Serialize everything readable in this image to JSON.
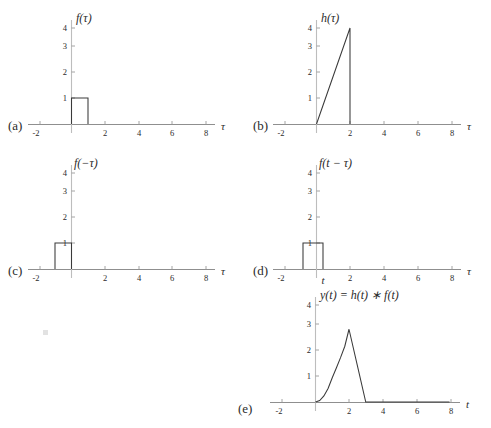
{
  "figure": {
    "background": "#ffffff",
    "curve_color": "#3a3a3a",
    "axis_color": "#8f8f8f",
    "text_color": "#2b2b2b"
  },
  "panels": {
    "a": {
      "tag": "(a)",
      "title": "f(τ)",
      "xlabel": "τ",
      "xticks": [
        "-2",
        "2",
        "4",
        "6",
        "8"
      ],
      "yticks": [
        "1",
        "2",
        "3",
        "4"
      ]
    },
    "b": {
      "tag": "(b)",
      "title": "h(τ)",
      "xlabel": "τ",
      "xticks": [
        "-2",
        "2",
        "4",
        "6",
        "8"
      ],
      "yticks": [
        "1",
        "2",
        "3",
        "4"
      ]
    },
    "c": {
      "tag": "(c)",
      "title": "f(−τ)",
      "xlabel": "τ",
      "xticks": [
        "-2",
        "2",
        "4",
        "6",
        "8"
      ],
      "yticks": [
        "1",
        "2",
        "3",
        "4"
      ]
    },
    "d": {
      "tag": "(d)",
      "title": "f(t − τ)",
      "xlabel": "τ",
      "xticks": [
        "-2",
        "2",
        "4",
        "6",
        "8"
      ],
      "yticks": [
        "1",
        "2",
        "3",
        "4"
      ],
      "shift_marker": "t"
    },
    "e": {
      "tag": "(e)",
      "title": "y(t) = h(t) ∗ f(t)",
      "xlabel": "t",
      "xticks": [
        "-2",
        "2",
        "4",
        "6",
        "8"
      ],
      "yticks": [
        "1",
        "2",
        "3",
        "4"
      ]
    }
  },
  "chart_data": [
    {
      "type": "line",
      "panel": "a",
      "title": "f(τ)",
      "xlabel": "τ",
      "ylabel": "",
      "xlim": [
        -2,
        8
      ],
      "ylim": [
        0,
        4.4
      ],
      "xticks": [
        -2,
        2,
        4,
        6,
        8
      ],
      "yticks": [
        1,
        2,
        3,
        4
      ],
      "grid": false,
      "legend": "none",
      "description": "Unit rectangular pulse of height 1 from tau=0 to tau=1",
      "x": [
        -2,
        0,
        0,
        1,
        1,
        8
      ],
      "values": [
        0,
        0,
        1,
        1,
        0,
        0
      ]
    },
    {
      "type": "line",
      "panel": "b",
      "title": "h(τ)",
      "xlabel": "τ",
      "ylabel": "",
      "xlim": [
        -2,
        8
      ],
      "ylim": [
        0,
        4.4
      ],
      "xticks": [
        -2,
        2,
        4,
        6,
        8
      ],
      "yticks": [
        1,
        2,
        3,
        4
      ],
      "grid": false,
      "legend": "none",
      "description": "Ramp rising linearly from (0,0) to (2,4), then dropping to 0",
      "x": [
        -2,
        0,
        2,
        2,
        8
      ],
      "values": [
        0,
        0,
        4,
        0,
        0
      ]
    },
    {
      "type": "line",
      "panel": "c",
      "title": "f(−τ)",
      "xlabel": "τ",
      "ylabel": "",
      "xlim": [
        -2,
        8
      ],
      "ylim": [
        0,
        4.4
      ],
      "xticks": [
        -2,
        2,
        4,
        6,
        8
      ],
      "yticks": [
        1,
        2,
        3,
        4
      ],
      "grid": false,
      "legend": "none",
      "description": "Time-reversed unit pulse of height 1 from tau=-1 to tau=0",
      "x": [
        -2,
        -1,
        -1,
        0,
        0,
        8
      ],
      "values": [
        0,
        0,
        1,
        1,
        0,
        0
      ]
    },
    {
      "type": "line",
      "panel": "d",
      "title": "f(t − τ)",
      "xlabel": "τ",
      "ylabel": "",
      "xlim": [
        -2,
        8
      ],
      "ylim": [
        0,
        4.4
      ],
      "xticks": [
        -2,
        2,
        4,
        6,
        8
      ],
      "yticks": [
        1,
        2,
        3,
        4
      ],
      "grid": false,
      "legend": "none",
      "description": "Shifted time-reversed unit pulse of height 1 from tau=t-1 to tau=t, with t slightly right of origin",
      "x": [
        -2,
        -0.8,
        -0.8,
        0.2,
        0.2,
        8
      ],
      "values": [
        0,
        0,
        1,
        1,
        0,
        0
      ],
      "annotations": [
        {
          "text": "t",
          "x": 0.2,
          "y": 0
        }
      ]
    },
    {
      "type": "line",
      "panel": "e",
      "title": "y(t) = h(t) ∗ f(t)",
      "xlabel": "t",
      "ylabel": "",
      "xlim": [
        -2,
        8
      ],
      "ylim": [
        0,
        4.4
      ],
      "xticks": [
        -2,
        2,
        4,
        6,
        8
      ],
      "yticks": [
        1,
        2,
        3,
        4
      ],
      "grid": false,
      "legend": "none",
      "description": "Convolution result: parabolic rise t^2 on 0<=t<=2 reaching peak 3 at t=2, then linear decay to 0 at t=3",
      "x": [
        -2,
        0,
        0.25,
        0.5,
        0.75,
        1,
        1.25,
        1.5,
        1.75,
        2,
        2.5,
        3,
        8
      ],
      "values": [
        0,
        0,
        0.06,
        0.25,
        0.56,
        1,
        1.41,
        1.84,
        2.3,
        3,
        1.5,
        0,
        0
      ]
    }
  ]
}
